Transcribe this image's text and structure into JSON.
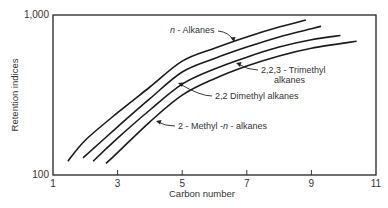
{
  "chart_data": {
    "type": "line",
    "title": "",
    "xlabel": "Carbon number",
    "ylabel": "Retention indices",
    "xlim": [
      1,
      11
    ],
    "ylim": [
      100,
      1000
    ],
    "yscale": "log",
    "grid": false,
    "legend": "none (curves labeled with arrow annotations)",
    "x_ticks": [
      1,
      3,
      5,
      7,
      9,
      11
    ],
    "x_tick_labels": [
      "1",
      "3",
      "5",
      "7",
      "9",
      "11"
    ],
    "y_ticks": [
      100,
      1000
    ],
    "y_tick_labels": [
      "100",
      "1,000"
    ],
    "series": [
      {
        "name": "n-Alkanes",
        "label_prefix": "n",
        "label_suffix": " - Alkanes",
        "x": [
          1.46,
          2,
          3,
          4,
          5,
          6,
          7,
          8,
          8.83
        ],
        "y": [
          122,
          165,
          245,
          355,
          515,
          620,
          730,
          840,
          930
        ]
      },
      {
        "name": "2,2,3-Trimethyl alkanes",
        "label_line1": "2,2,3 - Trimethyl",
        "label_line2": "alkanes",
        "x": [
          1.93,
          3,
          4,
          5,
          6,
          7,
          8,
          9,
          9.3
        ],
        "y": [
          128,
          200,
          300,
          440,
          535,
          630,
          730,
          820,
          850
        ]
      },
      {
        "name": "2,2 Dimethyl alkanes",
        "label": "2,2 Dimethyl alkanes",
        "x": [
          2.24,
          3,
          4,
          5,
          6,
          7,
          8,
          9,
          9.9
        ],
        "y": [
          122,
          170,
          255,
          370,
          460,
          545,
          630,
          700,
          745
        ]
      },
      {
        "name": "2-Methyl-n-alkanes",
        "label_prefix": "2 - Methyl -",
        "label_italic": "n",
        "label_suffix": " - alkanes",
        "x": [
          2.64,
          3,
          4,
          5,
          6,
          7,
          8,
          9,
          10.4
        ],
        "y": [
          118,
          138,
          215,
          316,
          400,
          480,
          555,
          620,
          685
        ]
      }
    ]
  }
}
